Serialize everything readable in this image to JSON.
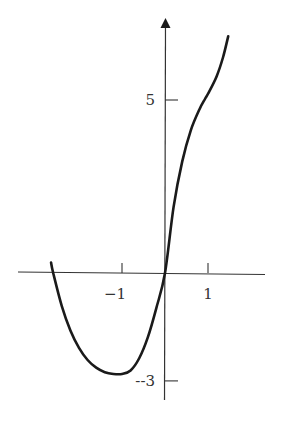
{
  "chart_data": {
    "type": "line",
    "title": "",
    "xlabel": "",
    "ylabel": "",
    "xlim": [
      -3.4,
      2.3
    ],
    "ylim": [
      -3.7,
      7.3
    ],
    "grid": false,
    "legend": null,
    "x_ticks": [
      {
        "value": -1,
        "label": "−1"
      },
      {
        "value": 1,
        "label": "1"
      }
    ],
    "y_ticks": [
      {
        "value": 5,
        "label": "5"
      },
      {
        "value": -3,
        "label": "--3"
      }
    ],
    "series": [
      {
        "name": "f(x)",
        "x": [
          -2.65,
          -2.6,
          -2.4,
          -2.2,
          -2.0,
          -1.8,
          -1.6,
          -1.4,
          -1.2,
          -1.0,
          -0.8,
          -0.6,
          -0.4,
          -0.2,
          0.0,
          0.2,
          0.4,
          0.6,
          0.8,
          0.93,
          1.0,
          1.2,
          1.35,
          1.47
        ],
        "y": [
          0.3,
          0.0,
          -0.95,
          -1.65,
          -2.15,
          -2.5,
          -2.72,
          -2.85,
          -2.9,
          -2.9,
          -2.8,
          -2.45,
          -1.85,
          -1.0,
          0.0,
          1.9,
          3.2,
          4.1,
          4.7,
          5.0,
          5.15,
          5.65,
          6.2,
          6.8
        ]
      }
    ]
  }
}
